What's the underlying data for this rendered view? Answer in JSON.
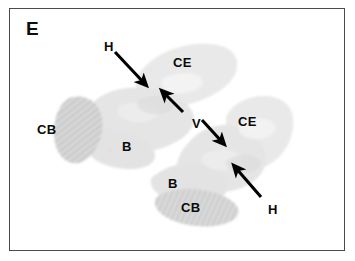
{
  "figure": {
    "panel_letter": "E",
    "domain": "histology-micrograph",
    "background_color": "#ffffff",
    "frame_color": "#4a4a4a",
    "label_color": "#0a0a0a",
    "tissue_fill_color": "#e9e9e9",
    "tissue_mid_color": "#dedede",
    "tissue_dark_color": "#c9c9c9",
    "arrow_color": "#000000"
  },
  "annotations": {
    "labels": [
      {
        "id": "h-top",
        "text": "H",
        "x": 104,
        "y": 40,
        "region": "hippocampus"
      },
      {
        "id": "ce-top",
        "text": "CE",
        "x": 173,
        "y": 56,
        "region": "cerebrum"
      },
      {
        "id": "cb-left",
        "text": "CB",
        "x": 37,
        "y": 123,
        "region": "cerebellum"
      },
      {
        "id": "b-left",
        "text": "B",
        "x": 122,
        "y": 140,
        "region": "brainstem"
      },
      {
        "id": "v-mid",
        "text": "V",
        "x": 192,
        "y": 117,
        "region": "ventricle"
      },
      {
        "id": "ce-right",
        "text": "CE",
        "x": 238,
        "y": 115,
        "region": "cerebrum"
      },
      {
        "id": "b-bottom",
        "text": "B",
        "x": 168,
        "y": 177,
        "region": "brainstem"
      },
      {
        "id": "cb-bottom",
        "text": "CB",
        "x": 181,
        "y": 201,
        "region": "cerebellum"
      },
      {
        "id": "h-bottom",
        "text": "H",
        "x": 268,
        "y": 203,
        "region": "hippocampus"
      }
    ],
    "arrows": [
      {
        "id": "arrow-h-top",
        "from_x": 115,
        "from_y": 52,
        "to_x": 145,
        "to_y": 84,
        "points_to": "H"
      },
      {
        "id": "arrow-v-upper",
        "from_x": 183,
        "from_y": 112,
        "to_x": 163,
        "to_y": 92,
        "points_to": "V"
      },
      {
        "id": "arrow-v-lower",
        "from_x": 202,
        "from_y": 120,
        "to_x": 223,
        "to_y": 143,
        "points_to": "V"
      },
      {
        "id": "arrow-h-bottom",
        "from_x": 261,
        "from_y": 197,
        "to_x": 235,
        "to_y": 167,
        "points_to": "H"
      }
    ]
  },
  "sections": [
    {
      "id": "section-upper-left",
      "description": "sagittal brain section, upper left, tilted"
    },
    {
      "id": "section-lower-right",
      "description": "sagittal brain section, lower right, tilted"
    }
  ]
}
